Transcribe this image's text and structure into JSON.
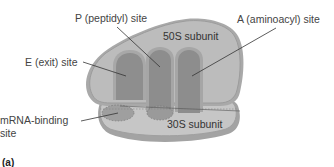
{
  "figure": {
    "panel_label": "(a)"
  },
  "subunits": {
    "large": {
      "label": "50S subunit"
    },
    "small": {
      "label": "30S subunit"
    }
  },
  "sites": {
    "e_site": {
      "label": "E (exit) site"
    },
    "p_site": {
      "label": "P (peptidyl) site"
    },
    "a_site": {
      "label": "A (aminoacyl) site"
    },
    "mrna_site": {
      "label_line1": "mRNA-binding",
      "label_line2": "site"
    }
  },
  "colors": {
    "large_subunit_fill": "#b9b9b9",
    "large_subunit_outline": "#9a9a9a",
    "small_subunit_fill": "#c4c4c4",
    "small_subunit_shadow": "#9d9d9d",
    "site_fill": "#8f8f8f",
    "site_rim": "#a8a8a8",
    "leader_line": "#333333",
    "text": "#444444"
  }
}
